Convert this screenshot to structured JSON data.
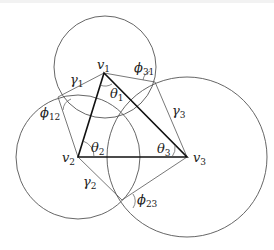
{
  "diagram": {
    "type": "geometric-figure",
    "vertices": {
      "v1": {
        "label": "v",
        "sub": "1"
      },
      "v2": {
        "label": "v",
        "sub": "2"
      },
      "v3": {
        "label": "v",
        "sub": "3"
      }
    },
    "angles": {
      "theta1": {
        "label": "θ",
        "sub": "1"
      },
      "theta2": {
        "label": "θ",
        "sub": "2"
      },
      "theta3": {
        "label": "θ",
        "sub": "3"
      },
      "phi12": {
        "label": "ϕ",
        "sub": "12"
      },
      "phi23": {
        "label": "ϕ",
        "sub": "23"
      },
      "phi31": {
        "label": "ϕ",
        "sub": "31"
      }
    },
    "edges": {
      "gamma1": {
        "label": "γ",
        "sub": "1"
      },
      "gamma2": {
        "label": "γ",
        "sub": "2"
      },
      "gamma3": {
        "label": "γ",
        "sub": "3"
      }
    },
    "colors": {
      "stroke": "#555555",
      "triangle": "#111111",
      "text": "#222222"
    }
  }
}
